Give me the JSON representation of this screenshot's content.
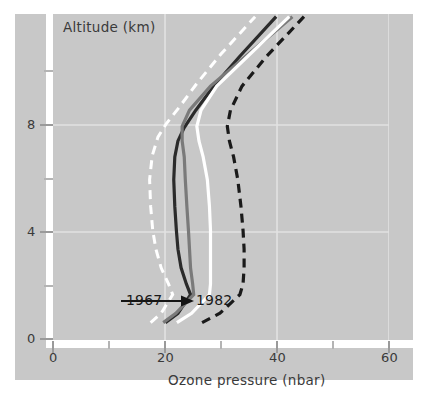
{
  "figure": {
    "background_color": "#ffffff",
    "panel_color": "#c8c8c8",
    "gridline_color": "#e0e0e0",
    "axis_color": "#ffffff"
  },
  "chart_data": {
    "type": "line",
    "title": "",
    "xlabel": "Ozone pressure (nbar)",
    "ylabel": "Altitude (km)",
    "xlim": [
      0,
      64
    ],
    "ylim": [
      0,
      12.2
    ],
    "xticks": [
      0,
      20,
      40,
      60
    ],
    "xticklabels": [
      "0",
      "20",
      "40",
      "60"
    ],
    "xminorticks": [
      10,
      30,
      50
    ],
    "yticks": [
      0,
      4,
      8
    ],
    "yticklabels": [
      "0",
      "4",
      "8"
    ],
    "yminorticks": [
      2,
      6,
      10
    ],
    "grid": true,
    "legend": "none",
    "annotations": [
      {
        "name": "year-progression",
        "start_label": "1967",
        "end_label": "1982",
        "arrow": "right",
        "x": 22.0,
        "y": 1.45
      }
    ],
    "series": [
      {
        "name": "1967",
        "color": "#ffffff",
        "style": "dashed",
        "width": 3.0,
        "x": [
          18.6,
          20.6,
          22.8,
          22.0,
          20.6,
          19.6,
          19.0,
          18.6,
          18.4,
          18.9,
          20.0,
          21.6,
          24.0,
          27.4,
          32.0,
          38.5
        ],
        "y": [
          0.65,
          1.0,
          1.7,
          2.1,
          2.7,
          3.4,
          4.1,
          5.0,
          6.0,
          6.9,
          7.6,
          8.1,
          8.7,
          9.6,
          10.7,
          12.1
        ]
      },
      {
        "name": "1971",
        "color": "#2b2b2b",
        "style": "solid",
        "width": 3.2,
        "x": [
          21.4,
          23.8,
          26.2,
          25.4,
          24.4,
          23.8,
          23.5,
          23.2,
          23.0,
          23.2,
          23.8,
          25.0,
          27.2,
          30.6,
          35.5,
          42.5
        ],
        "y": [
          0.65,
          1.0,
          1.7,
          2.1,
          2.7,
          3.4,
          4.1,
          5.0,
          6.0,
          6.85,
          7.45,
          7.95,
          8.6,
          9.5,
          10.6,
          12.1
        ]
      },
      {
        "name": "1975",
        "color": "#7a7a7a",
        "style": "solid",
        "width": 3.2,
        "x": [
          21.0,
          23.4,
          26.8,
          26.6,
          26.2,
          26.0,
          25.8,
          25.5,
          25.2,
          25.0,
          24.6,
          24.6,
          26.0,
          30.0,
          36.6,
          45.6
        ],
        "y": [
          0.65,
          1.0,
          1.7,
          2.1,
          2.7,
          3.4,
          4.1,
          5.0,
          6.0,
          6.85,
          7.45,
          8.0,
          8.6,
          9.5,
          10.6,
          12.1
        ]
      },
      {
        "name": "1978",
        "color": "#ffffff",
        "style": "solid",
        "width": 3.2,
        "x": [
          23.6,
          26.4,
          29.8,
          30.0,
          30.0,
          30.0,
          30.0,
          29.8,
          29.4,
          28.6,
          27.8,
          27.4,
          28.2,
          31.2,
          37.0,
          45.0
        ],
        "y": [
          0.65,
          1.0,
          1.7,
          2.1,
          2.7,
          3.4,
          4.1,
          5.0,
          6.0,
          6.85,
          7.45,
          8.0,
          8.6,
          9.5,
          10.6,
          12.1
        ]
      },
      {
        "name": "1982",
        "color": "#1a1a1a",
        "style": "dashed",
        "width": 3.2,
        "x": [
          28.4,
          31.8,
          35.6,
          36.2,
          36.4,
          36.4,
          36.2,
          35.8,
          35.2,
          34.4,
          33.6,
          33.2,
          33.8,
          36.0,
          40.6,
          47.8
        ],
        "y": [
          0.65,
          1.0,
          1.7,
          2.1,
          2.7,
          3.4,
          4.1,
          5.0,
          6.0,
          6.85,
          7.45,
          8.0,
          8.6,
          9.5,
          10.6,
          12.1
        ]
      }
    ]
  },
  "labels": {
    "y_axis_title": "Altitude (km)",
    "x_axis_title": "Ozone pressure (nbar)",
    "y_0": "0",
    "y_4": "4",
    "y_8": "8",
    "x_0": "0",
    "x_20": "20",
    "x_40": "40",
    "x_60": "60",
    "annot_start": "1967",
    "annot_end": "1982"
  }
}
